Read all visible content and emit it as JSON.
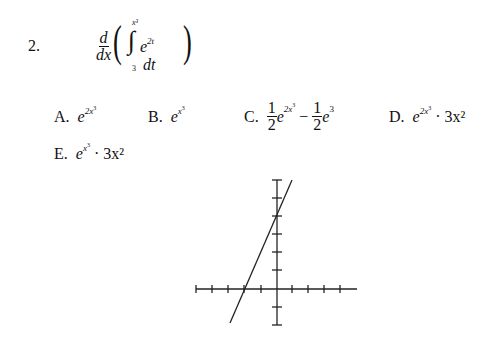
{
  "question": {
    "number": "2.",
    "expression": {
      "derivative_num": "d",
      "derivative_den": "dx",
      "integral_upper": "x³",
      "integral_lower": "3",
      "integrand_base": "e",
      "integrand_exp": "2t",
      "differential": "dt"
    }
  },
  "choices": [
    {
      "label": "A.",
      "base": "e",
      "exp": "2x",
      "exp_sup": "3",
      "tail": ""
    },
    {
      "label": "B.",
      "base": "e",
      "exp": "x",
      "exp_sup": "3",
      "tail": ""
    },
    {
      "label": "C.",
      "coef1": "1/2",
      "base1": "e",
      "exp1": "2x",
      "exp1_sup": "3",
      "op": "−",
      "coef2": "1/2",
      "base2": "e",
      "exp2": "3"
    },
    {
      "label": "D.",
      "base": "e",
      "exp": "2x",
      "exp_sup": "3",
      "tail": "· 3x²"
    },
    {
      "label": "E.",
      "base": "e",
      "exp": "x",
      "exp_sup": "3",
      "tail": "· 3x²"
    }
  ],
  "graph": {
    "x_axis_ticks": [
      -5,
      -4,
      -3,
      -2,
      -1,
      1,
      2,
      3,
      4,
      5
    ],
    "y_axis_ticks": [
      -1,
      1,
      2,
      3,
      4,
      5,
      6
    ],
    "line": {
      "x_intercept": -2,
      "y_intercept": 4,
      "slope": 2
    }
  },
  "fraction_parts": {
    "one": "1",
    "two": "2"
  }
}
